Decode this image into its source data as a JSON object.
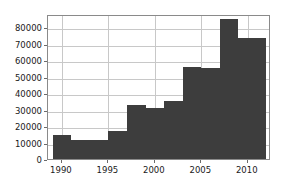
{
  "chart_data": {
    "type": "bar",
    "title": "",
    "subtitle": "",
    "xlabel": "",
    "ylabel": "",
    "grid": true,
    "legend": null,
    "xlim": [
      1988.5,
      2012.5
    ],
    "ylim": [
      0,
      88000
    ],
    "xticks": [
      1990,
      1995,
      2000,
      2005,
      2010
    ],
    "xtick_labels": [
      "1990",
      "1995",
      "2000",
      "2005",
      "2010"
    ],
    "yticks": [
      0,
      10000,
      20000,
      30000,
      40000,
      50000,
      60000,
      70000,
      80000
    ],
    "ytick_labels": [
      "0",
      "10000",
      "20000",
      "30000",
      "40000",
      "50000",
      "60000",
      "70000",
      "80000"
    ],
    "bar_color": "#3d3d3d",
    "grid_color": "#c8c8c8",
    "axis_color": "#8a8a8a",
    "categories": [
      1989,
      1991,
      1993,
      1995,
      1997,
      1999,
      2001,
      2003,
      2005,
      2007,
      2009
    ],
    "bins": [
      {
        "x0": 1989,
        "x1": 1991,
        "value": 14500
      },
      {
        "x0": 1991,
        "x1": 1993,
        "value": 11500
      },
      {
        "x0": 1993,
        "x1": 1995,
        "value": 11500
      },
      {
        "x0": 1995,
        "x1": 1997,
        "value": 17000
      },
      {
        "x0": 1997,
        "x1": 1999,
        "value": 32500
      },
      {
        "x0": 1999,
        "x1": 2001,
        "value": 31000
      },
      {
        "x0": 2001,
        "x1": 2003,
        "value": 35500
      },
      {
        "x0": 2003,
        "x1": 2005,
        "value": 56000
      },
      {
        "x0": 2005,
        "x1": 2007,
        "value": 55000
      },
      {
        "x0": 2007,
        "x1": 2009,
        "value": 85000
      },
      {
        "x0": 2009,
        "x1": 2012,
        "value": 73500
      }
    ],
    "values": [
      14500,
      11500,
      11500,
      17000,
      32500,
      31000,
      35500,
      56000,
      55000,
      85000,
      73500
    ]
  }
}
